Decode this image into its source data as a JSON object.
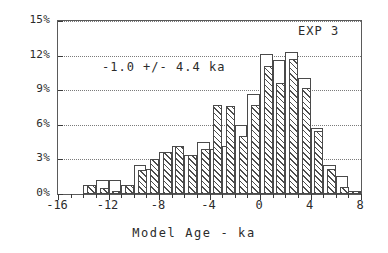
{
  "chart_data": {
    "type": "bar",
    "title": "",
    "subtitle": "",
    "xlabel": "Model Age - ka",
    "ylabel": "",
    "xlim": [
      -16,
      8
    ],
    "ylim": [
      0,
      15
    ],
    "grid": true,
    "legend_position": "none",
    "bin_width": 1,
    "x_tick_labels": [
      "-16",
      "-12",
      "-8",
      "-4",
      "0",
      "4",
      "8"
    ],
    "x_tick_values": [
      -16,
      -12,
      -8,
      -4,
      0,
      4,
      8
    ],
    "y_tick_labels": [
      "0%",
      "3%",
      "6%",
      "9%",
      "12%",
      "15%"
    ],
    "y_tick_values": [
      0,
      3,
      6,
      9,
      12,
      15
    ],
    "annotations": [
      {
        "name": "experiment-label",
        "text": "EXP 3"
      },
      {
        "name": "mean-uncertainty-label",
        "text": "-1.0 +/- 4.4 ka"
      }
    ],
    "bin_left_edges": [
      -16,
      -15,
      -14,
      -13,
      -12,
      -11,
      -10,
      -9,
      -8,
      -7,
      -6,
      -5,
      -4,
      -3,
      -2,
      -1,
      0,
      1,
      2,
      3,
      4,
      5,
      6,
      7
    ],
    "series": [
      {
        "name": "open",
        "style": "open-outline",
        "values": [
          0,
          0,
          0.8,
          1.2,
          1.2,
          0.8,
          2.5,
          2.2,
          3.6,
          4.2,
          3.4,
          4.5,
          3.9,
          4.2,
          6.0,
          8.7,
          12.1,
          11.6,
          12.3,
          10.1,
          5.7,
          2.5,
          1.6,
          0.3
        ]
      },
      {
        "name": "hatched",
        "style": "hatched",
        "values": [
          0,
          0,
          0.8,
          0.5,
          0.3,
          0.8,
          2.1,
          3.0,
          3.6,
          4.2,
          3.4,
          3.9,
          7.7,
          7.6,
          5.0,
          7.7,
          11.1,
          9.6,
          11.7,
          9.2,
          5.5,
          2.2,
          0.6,
          0.3
        ]
      }
    ]
  }
}
